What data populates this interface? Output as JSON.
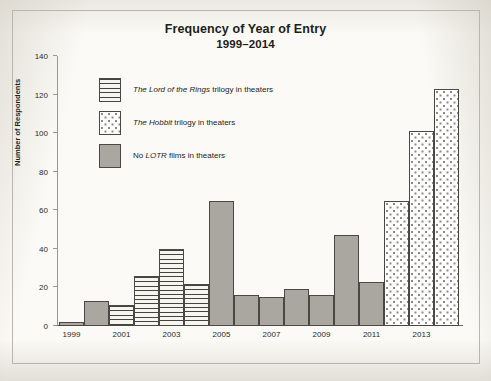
{
  "chart_data": {
    "type": "bar",
    "title": "Frequency of Year of Entry",
    "subtitle": "1999–2014",
    "xlabel": "",
    "ylabel": "Number of Respondents",
    "ylim": [
      0,
      140
    ],
    "yticks": [
      0,
      20,
      40,
      60,
      80,
      100,
      120,
      140
    ],
    "xticklabels": [
      "1999",
      "2001",
      "2003",
      "2005",
      "2007",
      "2009",
      "2011",
      "2013"
    ],
    "grid": false,
    "legend_position": "upper-left-inside",
    "categories": [
      "1999",
      "2000",
      "2001",
      "2002",
      "2003",
      "2004",
      "2005",
      "2006",
      "2007",
      "2008",
      "2009",
      "2010",
      "2011",
      "2012",
      "2013",
      "2014"
    ],
    "values": [
      2,
      13,
      11,
      26,
      40,
      22,
      65,
      16,
      15,
      19,
      16,
      47,
      23,
      65,
      101,
      123
    ],
    "point_styles": [
      "solid",
      "solid",
      "striped",
      "striped",
      "striped",
      "striped",
      "solid",
      "solid",
      "solid",
      "solid",
      "solid",
      "solid",
      "solid",
      "dotted",
      "dotted",
      "dotted"
    ],
    "legend": [
      {
        "key": "striped",
        "text_html": "<i>The Lord of the Rings</i> trilogy in theaters",
        "text": "The Lord of the Rings trilogy in theaters"
      },
      {
        "key": "dotted",
        "text_html": "<i>The Hobbit</i> trilogy in theaters",
        "text": "The Hobbit trilogy in theaters"
      },
      {
        "key": "solid",
        "text_html": "No <i>LOTR</i> films in theaters",
        "text": "No LOTR films in theaters"
      }
    ],
    "colors": {
      "solid_fill": "#a9a79f",
      "dotted_fill": "#ffffff",
      "striped_fill": "#f7f5ef",
      "bar_outline": "#4a4845",
      "axis": "#6f6c66",
      "text": "#1d1d1b",
      "page_background": "#fbfaf6"
    }
  }
}
